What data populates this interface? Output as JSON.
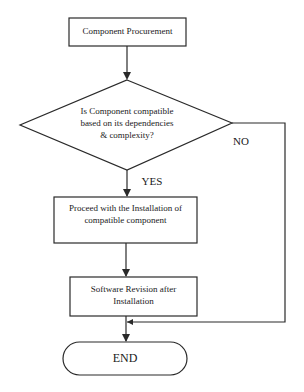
{
  "diagram": {
    "type": "flowchart",
    "nodes": [
      {
        "id": "procure",
        "shape": "rectangle",
        "text": "Component Procurement"
      },
      {
        "id": "check",
        "shape": "diamond",
        "text_lines": [
          "Is Component compatible",
          "based on its dependencies",
          "& complexity?"
        ]
      },
      {
        "id": "install",
        "shape": "rectangle",
        "text_lines": [
          "Proceed with the Installation of",
          "compatible component"
        ]
      },
      {
        "id": "revise",
        "shape": "rectangle",
        "text_lines": [
          "Software Revision after",
          "Installation"
        ]
      },
      {
        "id": "end",
        "shape": "terminator",
        "text": "END"
      }
    ],
    "edges": [
      {
        "from": "procure",
        "to": "check",
        "label": ""
      },
      {
        "from": "check",
        "to": "install",
        "label": "YES"
      },
      {
        "from": "check",
        "to": "end",
        "label": "NO"
      },
      {
        "from": "install",
        "to": "revise",
        "label": ""
      },
      {
        "from": "revise",
        "to": "end",
        "label": ""
      }
    ],
    "labels": {
      "yes": "YES",
      "no": "NO"
    },
    "colors": {
      "stroke": "#2a2a2a",
      "background": "#ffffff"
    }
  }
}
